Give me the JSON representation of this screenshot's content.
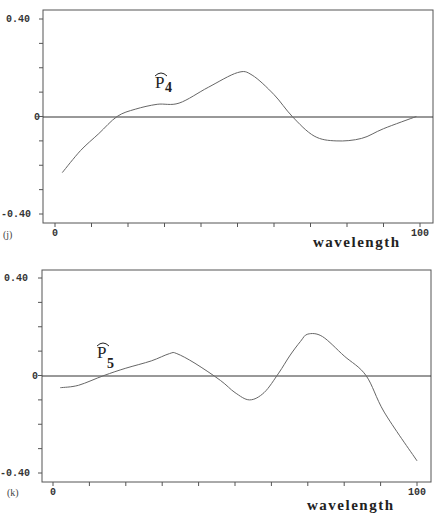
{
  "chart_data": [
    {
      "type": "line",
      "panel": "(j)",
      "title": "",
      "series_label": "p̂4",
      "series_label_base": "P",
      "series_label_sub": "4",
      "xlabel": "wavelength",
      "ylabel": "",
      "xlim": [
        0,
        100
      ],
      "ylim": [
        -0.4,
        0.4
      ],
      "x_tick_labels": [
        "0",
        "100"
      ],
      "y_tick_labels": [
        "0.40",
        "0",
        "-0.40"
      ],
      "x_minor_ticks": [
        0,
        10,
        20,
        30,
        40,
        50,
        60,
        70,
        80,
        90,
        100
      ],
      "y_minor_ticks": [
        -0.4,
        -0.3,
        -0.2,
        -0.1,
        0,
        0.1,
        0.2,
        0.3,
        0.4
      ],
      "grid": false,
      "zero_line": true,
      "series": [
        {
          "name": "p4",
          "x": [
            2,
            7,
            12,
            17,
            22,
            28,
            34,
            42,
            50,
            54,
            60,
            65,
            71,
            77,
            84,
            90,
            99
          ],
          "values": [
            -0.23,
            -0.14,
            -0.07,
            0.0,
            0.03,
            0.05,
            0.055,
            0.12,
            0.18,
            0.17,
            0.09,
            0.0,
            -0.08,
            -0.1,
            -0.09,
            -0.05,
            0.0
          ]
        }
      ]
    },
    {
      "type": "line",
      "panel": "(k)",
      "title": "",
      "series_label": "p̂5",
      "series_label_base": "P",
      "series_label_sub": "5",
      "xlabel": "wavelength",
      "ylabel": "",
      "xlim": [
        0,
        100
      ],
      "ylim": [
        -0.4,
        0.4
      ],
      "x_tick_labels": [
        "0",
        "100"
      ],
      "y_tick_labels": [
        "0.40",
        "0",
        "-0.40"
      ],
      "x_minor_ticks": [
        0,
        10,
        20,
        30,
        40,
        50,
        60,
        70,
        80,
        90,
        100
      ],
      "y_minor_ticks": [
        -0.4,
        -0.3,
        -0.2,
        -0.1,
        0,
        0.1,
        0.2,
        0.3,
        0.4
      ],
      "grid": false,
      "zero_line": true,
      "series": [
        {
          "name": "p5",
          "x": [
            2,
            7,
            14,
            20,
            27,
            32,
            34,
            39,
            46,
            50,
            54,
            58,
            62,
            65,
            68,
            70,
            74,
            80,
            86,
            91,
            100
          ],
          "values": [
            -0.05,
            -0.04,
            0.0,
            0.03,
            0.06,
            0.09,
            0.09,
            0.05,
            -0.02,
            -0.07,
            -0.1,
            -0.07,
            0.01,
            0.08,
            0.14,
            0.17,
            0.16,
            0.08,
            0.0,
            -0.15,
            -0.35
          ]
        }
      ]
    }
  ],
  "panels": [
    {
      "label": "(j)",
      "xlabel": "wavelength",
      "y_top": "0.40",
      "y_mid": "0",
      "y_bot": "-0.40",
      "x_left": "0",
      "x_right": "100",
      "curve_base": "P",
      "curve_sub": "4"
    },
    {
      "label": "(k)",
      "xlabel": "wavelength",
      "y_top": "0.40",
      "y_mid": "0",
      "y_bot": "-0.40",
      "x_left": "0",
      "x_right": "100",
      "curve_base": "P",
      "curve_sub": "5"
    }
  ],
  "colors": {
    "axis": "#555555",
    "curve": "#666666",
    "zero_line": "#333333",
    "background": "#ffffff"
  }
}
